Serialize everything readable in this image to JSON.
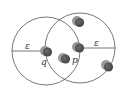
{
  "diagram": {
    "type": "epsilon-neighborhood",
    "colors": {
      "stroke": "#555555",
      "point_dark": "#555555",
      "point_light": "#9a9a9a",
      "background": "#ffffff"
    },
    "circles": [
      {
        "id": "left",
        "cx": 46,
        "cy": 51,
        "r": 34,
        "radius_label": "ε"
      },
      {
        "id": "right",
        "cx": 80,
        "cy": 48,
        "r": 35,
        "radius_label": "ε"
      }
    ],
    "points": [
      {
        "id": "q",
        "x": 47,
        "y": 51,
        "label": "q"
      },
      {
        "id": "p",
        "x": 65,
        "y": 58,
        "label": "p"
      },
      {
        "id": "center-right",
        "x": 80,
        "y": 48,
        "label": ""
      },
      {
        "id": "top",
        "x": 80,
        "y": 22,
        "label": ""
      },
      {
        "id": "bottom-right",
        "x": 110,
        "y": 67,
        "label": ""
      }
    ],
    "labels": {
      "epsilon_left": "ε",
      "epsilon_right": "ε",
      "q": "q",
      "p": "p"
    }
  }
}
